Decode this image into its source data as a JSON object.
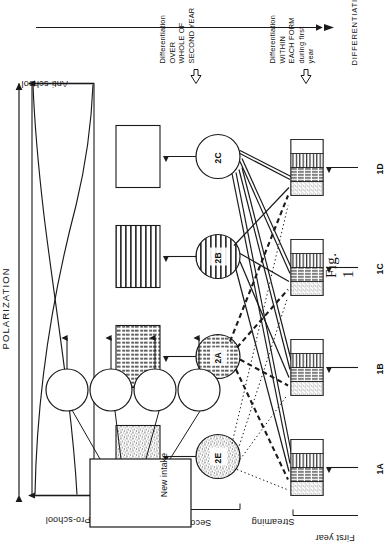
{
  "figure": {
    "caption": "Fig. 1",
    "overall_axis_label": "DIFFERENTIATION",
    "polarization_label": "POLARIZATION",
    "pro_school_label": "Pro-school",
    "anti_school_label": "Anti-school",
    "second_year_label": "Second year",
    "first_year_label": "First year",
    "streaming_label": "Streaming",
    "new_intake_label": "New intake",
    "annotation_second_year": "Differentiation OVER\nWHOLE OF SECOND YEAR",
    "annotation_first_year": "Differentiation WITHIN\nEACH FORM during first\nyear"
  },
  "first_year_forms": [
    {
      "id": "1A",
      "label": "1A"
    },
    {
      "id": "1B",
      "label": "1B"
    },
    {
      "id": "1C",
      "label": "1C"
    },
    {
      "id": "1D",
      "label": "1D"
    }
  ],
  "second_year_streams": [
    {
      "id": "2E",
      "label": "2E",
      "pattern": "stipple"
    },
    {
      "id": "2A",
      "label": "2A",
      "pattern": "grid"
    },
    {
      "id": "2B",
      "label": "2B",
      "pattern": "horizontal"
    },
    {
      "id": "2C",
      "label": "2C",
      "pattern": "blank"
    }
  ],
  "second_year_boxes": [
    {
      "id": "box-2E",
      "pattern": "stipple"
    },
    {
      "id": "box-2A",
      "pattern": "grid"
    },
    {
      "id": "box-2B",
      "pattern": "horizontal"
    },
    {
      "id": "box-2C",
      "pattern": "blank"
    }
  ],
  "first_year_box_bands": [
    "stipple",
    "grid",
    "horizontal",
    "blank"
  ],
  "polarization_chart": {
    "pro_school_curve": "descending",
    "anti_school_curve": "ascending"
  },
  "colors": {
    "ink": "#1a1a1a",
    "paper": "#ffffff",
    "stipple_fill": "#d8d8d8",
    "grid_fill": "#bfbfbf",
    "horizontal_fill": "#c9c9c9"
  }
}
